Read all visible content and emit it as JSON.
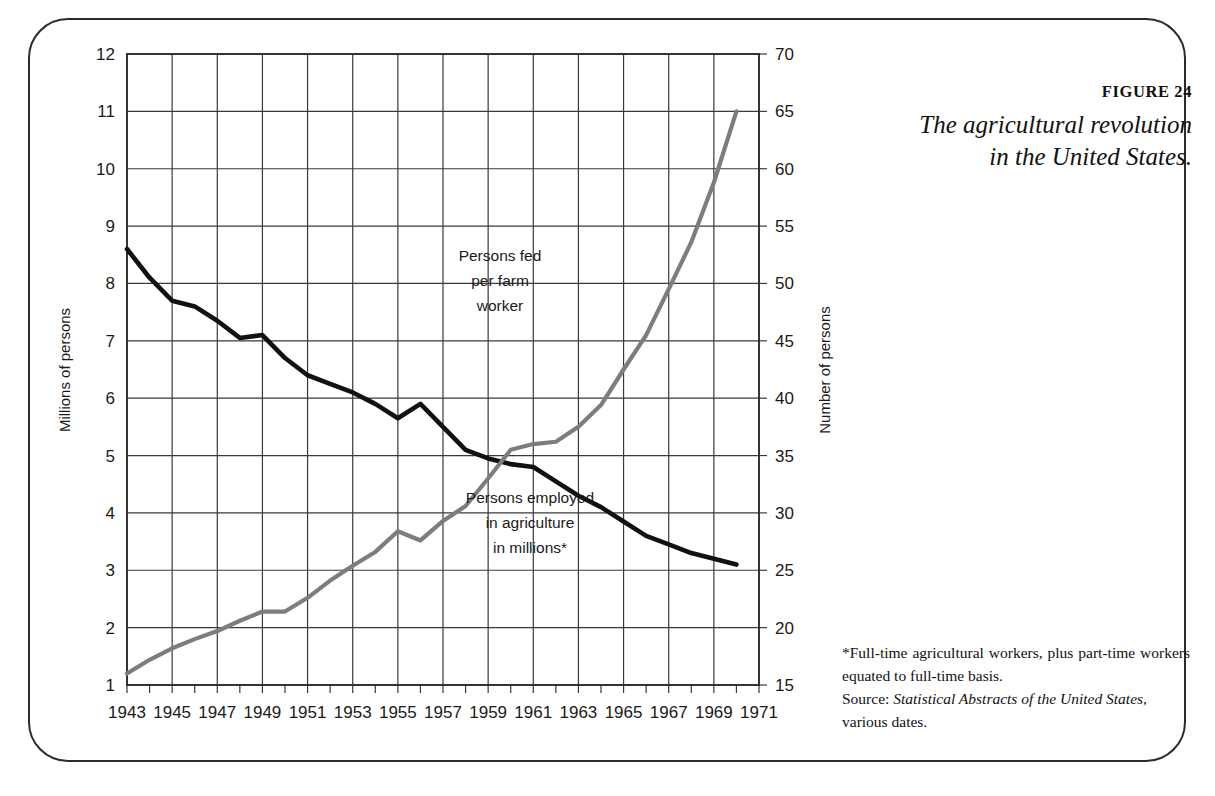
{
  "figure": {
    "number_label": "FIGURE 24",
    "title_line1": "The agricultural revolution",
    "title_line2": "in the United States."
  },
  "notes": {
    "footnote": "*Full-time agricultural workers, plus part-time workers equated to full-time basis.",
    "source_label": "Source: ",
    "source_title": "Statistical Abstracts of the United States",
    "source_suffix": ", various dates."
  },
  "annotations": {
    "persons_fed": {
      "line1": "Persons fed",
      "line2": "per farm",
      "line3": "worker"
    },
    "persons_employed": {
      "line1": "Persons employed",
      "line2": "in agriculture",
      "line3": "in millions*"
    }
  },
  "colors": {
    "employment_line": "#111111",
    "persons_fed_line": "#7d7d7d",
    "grid": "#3a3a3a",
    "frame": "#2b2b2b",
    "text": "#1a1a1a"
  },
  "chart_data": {
    "type": "line",
    "title": "The agricultural revolution in the United States.",
    "xlabel": "",
    "ylabel": "Millions of persons",
    "y2label": "Number of persons",
    "grid": true,
    "legend": "inline-annotations",
    "xlim": [
      1943,
      1971
    ],
    "xticks": [
      1943,
      1945,
      1947,
      1949,
      1951,
      1953,
      1955,
      1957,
      1959,
      1961,
      1963,
      1965,
      1967,
      1969,
      1971
    ],
    "ylim": [
      1,
      12
    ],
    "yticks": [
      1,
      2,
      3,
      4,
      5,
      6,
      7,
      8,
      9,
      10,
      11,
      12
    ],
    "y2lim": [
      15,
      70
    ],
    "y2ticks": [
      15,
      20,
      25,
      30,
      35,
      40,
      45,
      50,
      55,
      60,
      65,
      70
    ],
    "series": [
      {
        "name": "Persons employed in agriculture in millions*",
        "axis": "left",
        "units": "millions of persons",
        "color": "#111111",
        "x": [
          1943,
          1944,
          1945,
          1946,
          1947,
          1948,
          1949,
          1950,
          1951,
          1952,
          1953,
          1954,
          1955,
          1956,
          1957,
          1958,
          1959,
          1960,
          1961,
          1962,
          1963,
          1964,
          1965,
          1966,
          1967,
          1968,
          1969,
          1970
        ],
        "values": [
          8.6,
          8.1,
          7.7,
          7.6,
          7.35,
          7.05,
          7.1,
          6.7,
          6.4,
          6.25,
          6.1,
          5.9,
          5.65,
          5.9,
          5.5,
          5.1,
          4.95,
          4.85,
          4.8,
          4.55,
          4.3,
          4.1,
          3.85,
          3.6,
          3.45,
          3.3,
          3.2,
          3.1
        ]
      },
      {
        "name": "Persons fed per farm worker",
        "axis": "right",
        "units": "number of persons",
        "color": "#7d7d7d",
        "x": [
          1943,
          1944,
          1945,
          1946,
          1947,
          1948,
          1949,
          1950,
          1951,
          1952,
          1953,
          1954,
          1955,
          1956,
          1957,
          1958,
          1959,
          1960,
          1961,
          1962,
          1963,
          1964,
          1965,
          1966,
          1967,
          1968,
          1969,
          1970
        ],
        "values": [
          16.0,
          17.2,
          18.2,
          19.0,
          19.7,
          20.6,
          21.4,
          21.4,
          22.6,
          24.1,
          25.4,
          26.6,
          28.4,
          27.6,
          29.3,
          30.6,
          33.0,
          35.5,
          36.0,
          36.2,
          37.5,
          39.4,
          42.5,
          45.5,
          49.5,
          53.6,
          58.8,
          65.0
        ]
      }
    ],
    "left_axis_equivalents_for_persons_fed": [
      1.2,
      1.45,
      1.65,
      1.8,
      1.95,
      2.15,
      2.15,
      2.15,
      2.4,
      2.7,
      2.95,
      3.2,
      3.65,
      3.5,
      3.9,
      4.2,
      4.7,
      5.15,
      5.25,
      5.3,
      5.5,
      5.9,
      6.5,
      7.1,
      7.9,
      8.8,
      9.8,
      11.0
    ]
  }
}
